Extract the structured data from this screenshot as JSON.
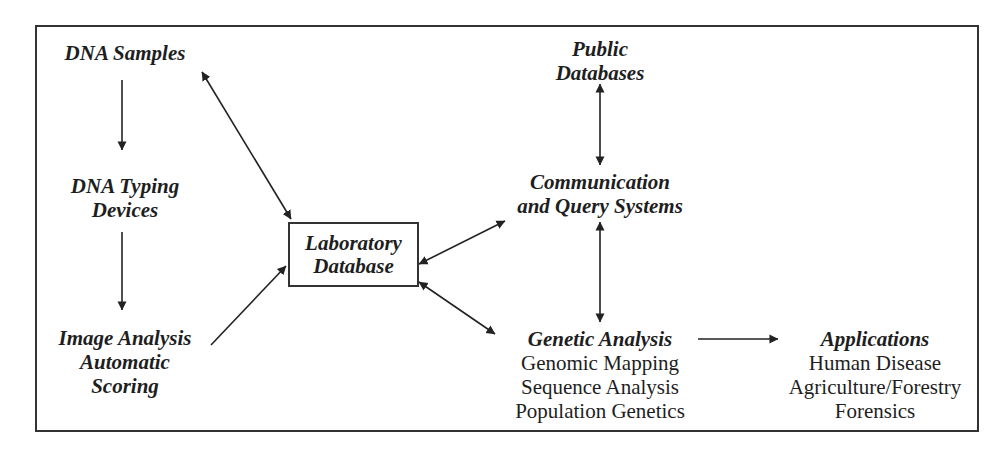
{
  "diagram": {
    "nodes": {
      "dna_samples": {
        "title": "DNA Samples"
      },
      "dna_typing": {
        "title_line1": "DNA Typing",
        "title_line2": "Devices"
      },
      "image_analysis": {
        "title_line1": "Image Analysis",
        "title_line2": "Automatic",
        "title_line3": "Scoring"
      },
      "lab_db": {
        "title_line1": "Laboratory",
        "title_line2": "Database"
      },
      "public_db": {
        "title_line1": "Public",
        "title_line2": "Databases"
      },
      "comm_query": {
        "title_line1": "Communication",
        "title_line2": "and Query Systems"
      },
      "genetic_analysis": {
        "title": "Genetic Analysis",
        "items": [
          "Genomic Mapping",
          "Sequence Analysis",
          "Population Genetics"
        ]
      },
      "applications": {
        "title": "Applications",
        "items": [
          "Human Disease",
          "Agriculture/Forestry",
          "Forensics"
        ]
      }
    },
    "edges": [
      {
        "from": "DNA Samples",
        "to": "DNA Typing Devices",
        "type": "one-way"
      },
      {
        "from": "DNA Typing Devices",
        "to": "Image Analysis Automatic Scoring",
        "type": "one-way"
      },
      {
        "from": "Image Analysis Automatic Scoring",
        "to": "Laboratory Database",
        "type": "one-way"
      },
      {
        "from": "DNA Samples",
        "to": "Laboratory Database",
        "type": "two-way"
      },
      {
        "from": "Laboratory Database",
        "to": "Communication and Query Systems",
        "type": "two-way"
      },
      {
        "from": "Laboratory Database",
        "to": "Genetic Analysis",
        "type": "two-way"
      },
      {
        "from": "Public Databases",
        "to": "Communication and Query Systems",
        "type": "two-way"
      },
      {
        "from": "Communication and Query Systems",
        "to": "Genetic Analysis",
        "type": "two-way"
      },
      {
        "from": "Genetic Analysis",
        "to": "Applications",
        "type": "one-way"
      }
    ],
    "colors": {
      "ink": "#1e1e1e",
      "border": "#333333",
      "background": "#ffffff"
    }
  }
}
